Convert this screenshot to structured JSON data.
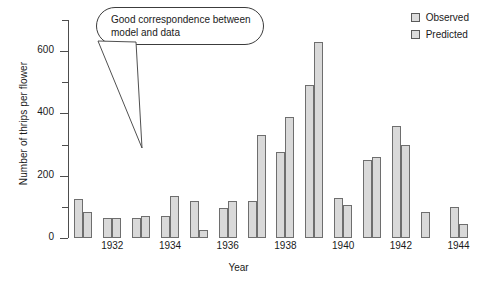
{
  "chart_data": {
    "type": "bar",
    "title": "",
    "xlabel": "Year",
    "ylabel": "Number of thrips per flower",
    "ylim": [
      0,
      700
    ],
    "grid": false,
    "legend_position": "top-right",
    "y_major_ticks": [
      0,
      200,
      400,
      600
    ],
    "y_minor_ticks": [
      100,
      300,
      500,
      700
    ],
    "y_tick_labels": [
      "0",
      "200",
      "400",
      "600"
    ],
    "categories": [
      1931,
      1932,
      1933,
      1934,
      1935,
      1936,
      1937,
      1938,
      1939,
      1940,
      1941,
      1942,
      1943,
      1944
    ],
    "x_tick_labels": [
      "1932",
      "1934",
      "1936",
      "1938",
      "1940",
      "1942",
      "1944"
    ],
    "x_tick_categories": [
      1932,
      1934,
      1936,
      1938,
      1940,
      1942,
      1944
    ],
    "series": [
      {
        "name": "Observed",
        "color": "#d9d9d9",
        "edge_color": "#6e6e6e",
        "values": [
          125,
          65,
          65,
          70,
          120,
          95,
          120,
          275,
          490,
          130,
          250,
          360,
          85,
          100
        ]
      },
      {
        "name": "Predicted",
        "color": "#d9d9d9",
        "edge_color": "#6e6e6e",
        "values": [
          85,
          65,
          70,
          135,
          25,
          120,
          330,
          390,
          630,
          105,
          260,
          300,
          0,
          45
        ]
      }
    ],
    "annotations": [
      {
        "name": "callout",
        "text": "Good correspondence between model and data",
        "shape": "rounded-speech-bubble",
        "pointer": "down-right"
      }
    ]
  },
  "legend": {
    "items": [
      {
        "label": "Observed"
      },
      {
        "label": "Predicted"
      }
    ]
  },
  "axes": {
    "y_title": "Number of thrips per flower",
    "x_title": "Year"
  },
  "colors": {
    "bar_fill": "#d9d9d9",
    "bar_edge": "#6e6e6e",
    "axis": "#4d4d4d",
    "text": "#1a1a1a",
    "callout_border": "#3c3c3c"
  }
}
